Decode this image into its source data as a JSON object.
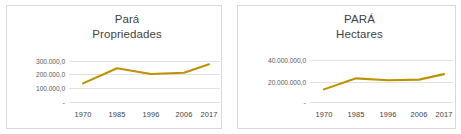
{
  "figure": {
    "background_color": "#FFFFFF",
    "panel_border_color": "#D9D9D9",
    "gridline_color": "#D9D9D9",
    "series_color": "#BF9000",
    "axis_label_color": "#595959"
  },
  "chart_data": [
    {
      "type": "line",
      "title": "Pará\nPropriedades",
      "title_lines": [
        "Pará",
        "Propriedades"
      ],
      "xlabel": "",
      "ylabel": "",
      "categories": [
        "1970",
        "1985",
        "1996",
        "2006",
        "2017"
      ],
      "x_tick_labels": [
        "1970",
        "1985",
        "1996",
        "2006",
        "2017"
      ],
      "y_tick_labels": [
        "300.000,0",
        "200.000,0",
        "100.000,0",
        "-"
      ],
      "y_tick_values": [
        300000,
        200000,
        100000,
        0
      ],
      "ylim": [
        0,
        340000
      ],
      "values": [
        140000,
        250000,
        208000,
        218000,
        280000
      ],
      "grid": true,
      "legend": "none",
      "series": [
        {
          "name": "Propriedades",
          "color": "#BF9000",
          "values": [
            140000,
            250000,
            208000,
            218000,
            280000
          ]
        }
      ]
    },
    {
      "type": "line",
      "title": "PARÁ\nHectares",
      "title_lines": [
        "PARÁ",
        "Hectares"
      ],
      "xlabel": "",
      "ylabel": "",
      "categories": [
        "1970",
        "1985",
        "1996",
        "2006",
        "2017"
      ],
      "x_tick_labels": [
        "1970",
        "1985",
        "1996",
        "2006",
        "2017"
      ],
      "y_tick_labels": [
        "40.000.000,0",
        "20.000.000,0",
        "-"
      ],
      "y_tick_values": [
        40000000,
        20000000,
        0
      ],
      "ylim": [
        0,
        48000000
      ],
      "values": [
        12500000,
        23000000,
        21200000,
        21800000,
        27000000
      ],
      "grid": true,
      "legend": "none",
      "series": [
        {
          "name": "Hectares",
          "color": "#BF9000",
          "values": [
            12500000,
            23000000,
            21200000,
            21800000,
            27000000
          ]
        }
      ]
    }
  ]
}
